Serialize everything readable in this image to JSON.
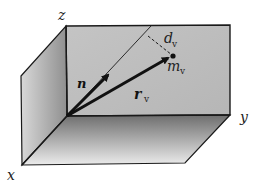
{
  "diagram": {
    "type": "3d-coordinate-box",
    "axes": {
      "x": "x",
      "y": "y",
      "z": "z"
    },
    "vectors": [
      {
        "name": "n",
        "label": "n",
        "style": "bold"
      },
      {
        "name": "r_v",
        "label": "r",
        "subscript": "v",
        "style": "bold-italic"
      }
    ],
    "point": {
      "label": "m",
      "subscript": "v"
    },
    "distance": {
      "label": "d",
      "subscript": "v",
      "style": "dashed"
    },
    "colors": {
      "back_panel": "#bdbdbd",
      "left_panel_dark": "#8c8c8c",
      "left_panel_light": "#d9d9d9",
      "floor_dark": "#7a7a7a",
      "floor_light": "#e6e6e6",
      "stroke": "#1a1a1a"
    }
  }
}
